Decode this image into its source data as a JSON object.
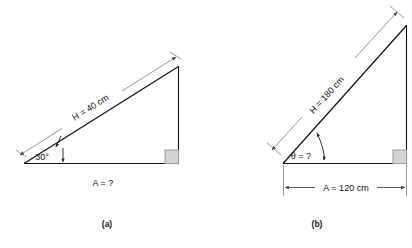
{
  "figure": {
    "type": "geometry-diagram",
    "background_color": "#ffffff",
    "line_color": "#111111",
    "dimension_line_color": "#8a8a8a",
    "right_angle_fill": "#d4d4d4",
    "right_angle_stroke": "#9a9a9a"
  },
  "panels": [
    {
      "caption": "(a)",
      "hypotenuse_label": "H = 40 cm",
      "hypotenuse_label_parts": {
        "symbol": "H",
        "equals": "=",
        "value": "40 cm"
      },
      "angle_label": "30°",
      "angle_value": 30,
      "angle_unit": "degrees",
      "adjacent_label": "A = ?",
      "adjacent_label_parts": {
        "symbol": "A",
        "equals": "=",
        "value": "?"
      },
      "right_angle_marker": "square",
      "known": [
        "H = 40 cm",
        "30°"
      ],
      "unknown": [
        "A"
      ]
    },
    {
      "caption": "(b)",
      "hypotenuse_label": "H = 180 cm",
      "hypotenuse_label_parts": {
        "symbol": "H",
        "equals": "=",
        "value": "180 cm"
      },
      "angle_label": "θ = ?",
      "angle_label_parts": {
        "symbol": "θ",
        "equals": "=",
        "value": "?"
      },
      "adjacent_label": "A = 120 cm",
      "adjacent_label_parts": {
        "symbol": "A",
        "equals": "=",
        "value": "120 cm"
      },
      "right_angle_marker": "square",
      "known": [
        "H = 180 cm",
        "A = 120 cm"
      ],
      "unknown": [
        "θ"
      ]
    }
  ]
}
